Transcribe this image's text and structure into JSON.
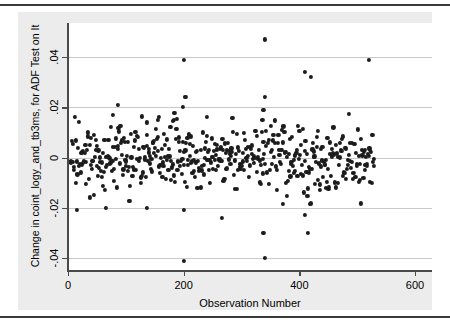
{
  "figure": {
    "background_color": "#ececec",
    "panel_color": "#ffffff",
    "point_color": "#1c1c1c",
    "grid_color": "#c8c8c8",
    "axis_color": "#4a4a4a"
  },
  "axis": {
    "x_title": "Observation Number",
    "y_title": "Change in coint_logy_and_tb3ms, for ADF Test on It",
    "x_ticks": [
      "0",
      "200",
      "400",
      "600"
    ],
    "y_ticks": [
      ".04",
      ".02",
      "0",
      "-.02",
      "-.04"
    ]
  },
  "chart_data": {
    "type": "scatter",
    "title": "",
    "xlabel": "Observation Number",
    "ylabel": "Change in coint_logy_and_tb3ms, for ADF Test on It",
    "xlim": [
      0,
      600
    ],
    "ylim": [
      -0.045,
      0.05
    ],
    "xticks": [
      0,
      200,
      400,
      600
    ],
    "yticks": [
      0.04,
      0.02,
      0,
      -0.02,
      -0.04
    ],
    "grid": "horizontal",
    "legend": "none",
    "marker": "filled-circle",
    "marker_color": "#1c1c1c",
    "n_points": 528,
    "x_range_observed": [
      3,
      532
    ],
    "y_center": 0.0,
    "y_core_spread": 0.006,
    "outliers": [
      {
        "x": 340,
        "y": 0.047
      },
      {
        "x": 200,
        "y": 0.039
      },
      {
        "x": 521,
        "y": 0.039
      },
      {
        "x": 410,
        "y": 0.034
      },
      {
        "x": 420,
        "y": 0.032
      },
      {
        "x": 203,
        "y": 0.024
      },
      {
        "x": 340,
        "y": 0.024
      },
      {
        "x": 86,
        "y": 0.021
      },
      {
        "x": 199,
        "y": 0.02
      },
      {
        "x": 338,
        "y": 0.019
      },
      {
        "x": 77,
        "y": 0.017
      },
      {
        "x": 240,
        "y": 0.016
      },
      {
        "x": 336,
        "y": 0.015
      },
      {
        "x": 137,
        "y": 0.014
      },
      {
        "x": 155,
        "y": 0.015
      },
      {
        "x": 183,
        "y": 0.015
      },
      {
        "x": 338,
        "y": -0.03
      },
      {
        "x": 415,
        "y": -0.03
      },
      {
        "x": 266,
        "y": -0.024
      },
      {
        "x": 410,
        "y": -0.023
      },
      {
        "x": 16,
        "y": -0.021
      },
      {
        "x": 66,
        "y": -0.02
      },
      {
        "x": 136,
        "y": -0.02
      },
      {
        "x": 200,
        "y": -0.021
      },
      {
        "x": 200,
        "y": -0.041
      },
      {
        "x": 340,
        "y": -0.04
      }
    ],
    "series": [
      {
        "name": "Change in coint_logy_and_tb3ms",
        "seed": 20240517,
        "n": 502,
        "x_min": 3,
        "x_max": 530,
        "sigma": 0.0058,
        "tail_prob": 0.1,
        "tail_scale": 2.2
      }
    ]
  }
}
